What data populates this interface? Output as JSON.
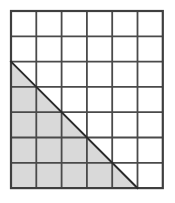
{
  "figure": {
    "name": "shaded-right-triangle-on-grid",
    "colors": {
      "background": "#ffffff",
      "grid_line": "#4a4a4a",
      "outer_border": "#3f3f3f",
      "diagonal_line": "#2b2b2b",
      "shading_fill": "#d9d9d9"
    },
    "grid": {
      "columns": 6,
      "rows": 7,
      "origin_x": 11,
      "origin_y": 11,
      "cell_width": 25.3,
      "cell_height": 25.3,
      "line_width": 1.8,
      "border_width": 2.2
    },
    "triangle": {
      "type": "right-triangle",
      "base_cells": 5,
      "height_cells": 5,
      "area_cells": 12.5,
      "right_angle_corner": "bottom-left",
      "vertices_cells": [
        {
          "col": 0,
          "row": 2
        },
        {
          "col": 0,
          "row": 7
        },
        {
          "col": 5,
          "row": 7
        }
      ],
      "hypotenuse_from_cells": {
        "col": 0,
        "row": 2
      },
      "hypotenuse_to_cells": {
        "col": 5,
        "row": 7
      },
      "diagonal_line_width": 2.0
    },
    "shaded_rows": [
      {
        "row_index": 3,
        "full_cells": 0,
        "partial_triangle_cell": 1
      },
      {
        "row_index": 4,
        "full_cells": 1,
        "partial_triangle_cell": 2
      },
      {
        "row_index": 5,
        "full_cells": 2,
        "partial_triangle_cell": 3
      },
      {
        "row_index": 6,
        "full_cells": 3,
        "partial_triangle_cell": 4
      },
      {
        "row_index": 7,
        "full_cells": 4,
        "partial_triangle_cell": 5
      }
    ]
  }
}
